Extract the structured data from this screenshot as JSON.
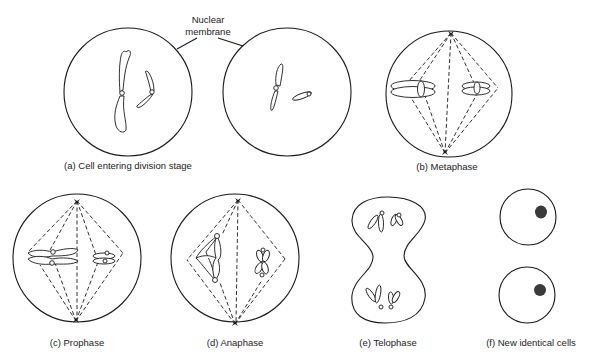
{
  "diagram": {
    "annotation": {
      "line1": "Nuclear",
      "line2": "membrane"
    },
    "stages": [
      {
        "id": "a",
        "label": "(a) Cell entering division stage"
      },
      {
        "id": "b",
        "label": "(b) Metaphase"
      },
      {
        "id": "c",
        "label": "(c) Prophase"
      },
      {
        "id": "d",
        "label": "(d) Anaphase"
      },
      {
        "id": "e",
        "label": "(e) Telophase"
      },
      {
        "id": "f",
        "label": "(f) New identical cells"
      }
    ]
  }
}
